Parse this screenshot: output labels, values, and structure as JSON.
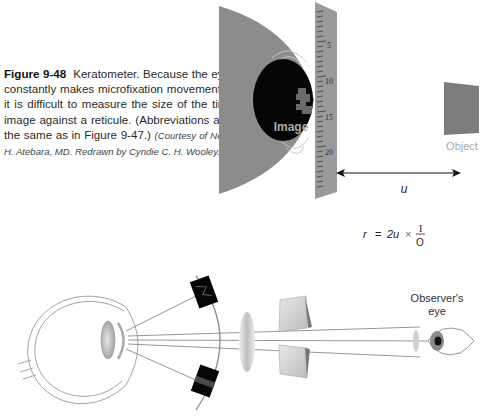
{
  "figure": {
    "label": "Figure 9-48",
    "text": "Keratometer. Because the eye constantly makes microfixation movements, it is difficult to measure the size of the tiny image against a reticule. (Abbreviations are the same as in Figure 9-47.)",
    "credit": "(Courtesy of Neal H. Atebara, MD. Redrawn by Cyndie C. H. Wooley.)"
  },
  "top_diagram": {
    "image_label": "Image",
    "object_label": "Object",
    "distance_label": "u",
    "ruler_ticks": [
      "5",
      "10",
      "15",
      "20"
    ],
    "formula": {
      "lhs": "r",
      "equals": "=",
      "factor": "2u",
      "times": "×",
      "numerator": "I",
      "denominator": "O"
    }
  },
  "bottom_diagram": {
    "observer_label_line1": "Observer's",
    "observer_label_line2": "eye"
  },
  "colors": {
    "cornea_gray": "#8c8c8c",
    "pupil_black": "#050505",
    "ruler_gray": "#9a9a9a",
    "object_gray": "#7c7c7c",
    "line_gray": "#888888",
    "text_dark": "#2a2a2a"
  }
}
